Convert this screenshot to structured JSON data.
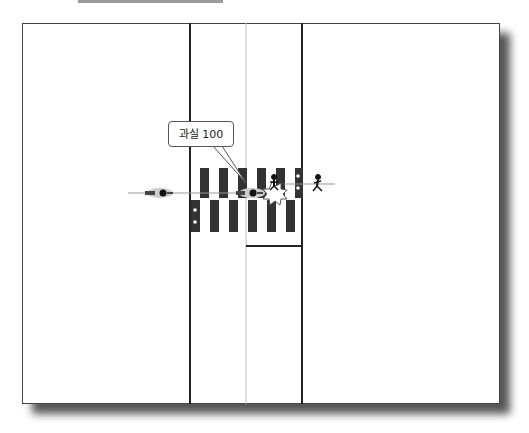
{
  "diagram": {
    "type": "accident-fault-diagram",
    "callout": {
      "label": "과실 100"
    },
    "elements": [
      {
        "name": "motorcycle-left",
        "icon": "motorcycle-icon"
      },
      {
        "name": "motorcycle-center",
        "icon": "motorcycle-icon"
      },
      {
        "name": "pedestrian-on-crosswalk",
        "icon": "pedestrian-icon"
      },
      {
        "name": "pedestrian-right",
        "icon": "pedestrian-icon"
      },
      {
        "name": "collision-mark",
        "icon": "collision-burst-icon"
      },
      {
        "name": "crosswalk",
        "icon": "crosswalk-stripes"
      },
      {
        "name": "traffic-signal-left",
        "icon": "traffic-light-icon"
      },
      {
        "name": "traffic-signal-right",
        "icon": "traffic-light-icon"
      }
    ],
    "colors": {
      "road_line": "#222222",
      "center_line": "#bbbbbb",
      "stripe": "#333333"
    }
  }
}
